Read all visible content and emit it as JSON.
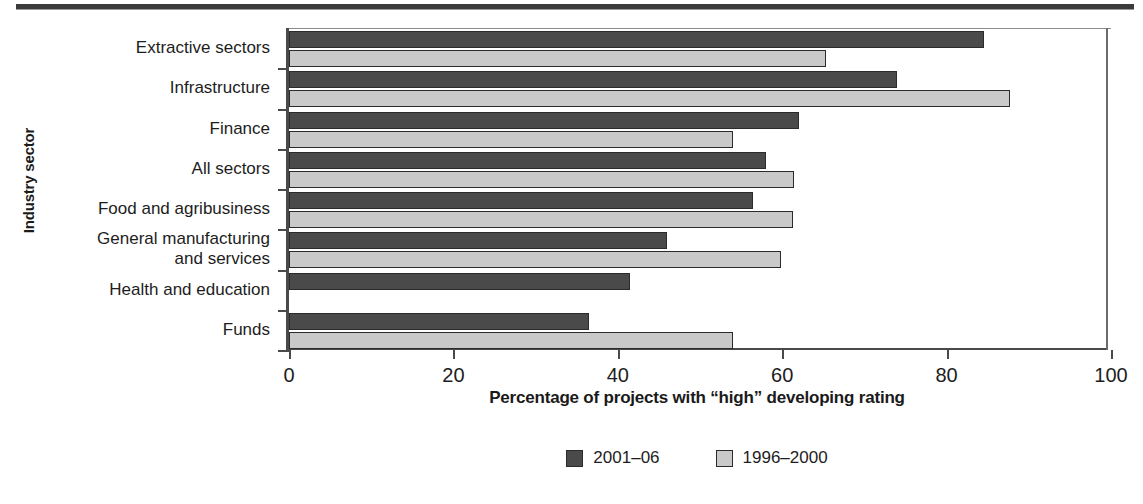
{
  "chart_data": {
    "type": "bar",
    "orientation": "horizontal",
    "title": "",
    "xlabel": "Percentage of projects with “high” developing rating",
    "ylabel": "Industry sector",
    "xlim": [
      0,
      100
    ],
    "xticks": [
      0,
      20,
      40,
      60,
      80,
      100
    ],
    "xticklabels": [
      "0",
      "20",
      "40",
      "60",
      "80",
      "100"
    ],
    "grid": false,
    "legend_position": "bottom-center",
    "categories": [
      "Extractive sectors",
      "Infrastructure",
      "Finance",
      "All sectors",
      "Food and agribusiness",
      "General manufacturing\nand services",
      "Health and education",
      "Funds"
    ],
    "series": [
      {
        "name": "2001–06",
        "color": "#4a4a4a",
        "values": [
          84.5,
          74.0,
          62.0,
          58.0,
          56.5,
          46.0,
          41.5,
          36.5
        ]
      },
      {
        "name": "1996–2000",
        "color": "#c9c9c9",
        "values": [
          65.3,
          87.7,
          54.0,
          61.4,
          61.3,
          59.8,
          null,
          54.0
        ]
      }
    ]
  },
  "legend": {
    "items": [
      {
        "label": "2001–06",
        "color": "#4a4a4a"
      },
      {
        "label": "1996–2000",
        "color": "#c9c9c9"
      }
    ]
  }
}
